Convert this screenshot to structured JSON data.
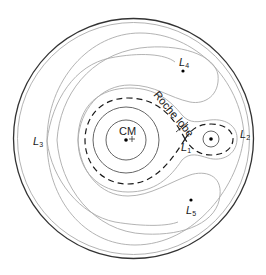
{
  "labels": {
    "cm": "CM",
    "roche_lobe": "Roche lobe",
    "l1": {
      "main": "L",
      "sub": "1"
    },
    "l2": {
      "main": "L",
      "sub": "2"
    },
    "l3": {
      "main": "L",
      "sub": "3"
    },
    "l4": {
      "main": "L",
      "sub": "4"
    },
    "l5": {
      "main": "L",
      "sub": "5"
    }
  },
  "colors": {
    "outer_circle": "#333333",
    "contour": "#a0a0a0",
    "inner_contour": "#555555",
    "roche_lobe": "#1a1a1a",
    "point": "#000000"
  }
}
